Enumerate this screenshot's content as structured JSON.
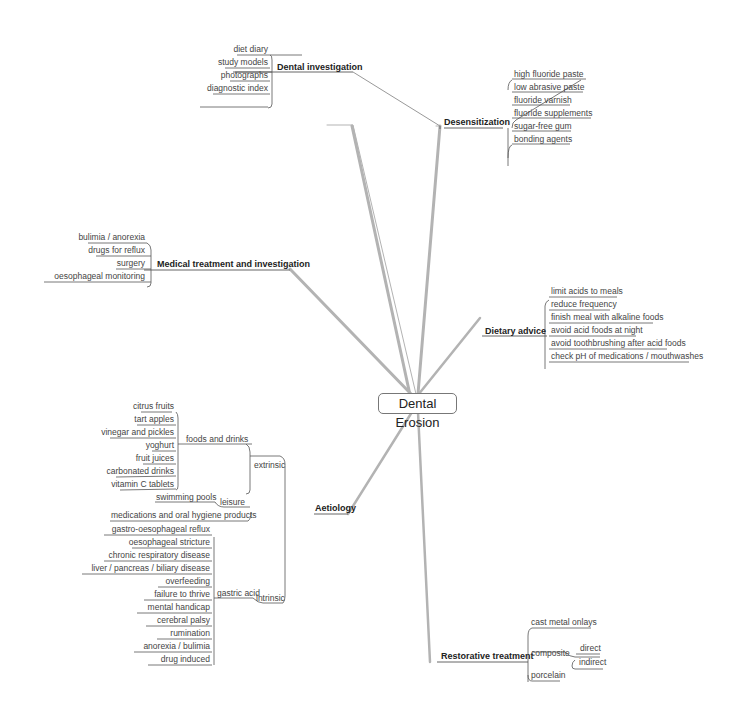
{
  "central_topic": "Dental Erosion",
  "branches": {
    "dental_investigation": {
      "title": "Dental investigation",
      "items": [
        "diet diary",
        "study models",
        "photographs",
        "diagnostic index"
      ]
    },
    "desensitization": {
      "title": "Desensitization",
      "items": [
        "high fluoride paste",
        "low abrasive paste",
        "fluoride varnish",
        "fluoride supplements",
        "sugar-free gum",
        "bonding agents"
      ]
    },
    "medical": {
      "title": "Medical treatment and investigation",
      "items": [
        "bulimia / anorexia",
        "drugs for reflux",
        "surgery",
        "oesophageal monitoring"
      ]
    },
    "dietary": {
      "title": "Dietary advice",
      "items": [
        "limit acids to meals",
        "reduce frequency",
        "finish meal with alkaline foods",
        "avoid acid foods at night",
        "avoid toothbrushing after acid foods",
        "check pH of medications / mouthwashes"
      ]
    },
    "aetiology": {
      "title": "Aetiology",
      "extrinsic": {
        "label": "extrinsic",
        "foods": {
          "label": "foods and drinks",
          "items": [
            "citrus fruits",
            "tart apples",
            "vinegar and pickles",
            "yoghurt",
            "fruit juices",
            "carbonated drinks",
            "vitamin C tablets"
          ]
        },
        "leisure": {
          "label": "leisure",
          "items": [
            "swimming pools"
          ]
        },
        "medications": "medications and oral hygiene products"
      },
      "intrinsic": {
        "label": "intrinsic",
        "gastric": {
          "label": "gastric acid",
          "items": [
            "gastro-oesophageal reflux",
            "oesophageal stricture",
            "chronic respiratory disease",
            "liver / pancreas / biliary disease",
            "overfeeding",
            "failure to thrive",
            "mental handicap",
            "cerebral palsy",
            "rumination",
            "anorexia / bulimia",
            "drug induced"
          ]
        }
      }
    },
    "restorative": {
      "title": "Restorative treatment",
      "items": {
        "cast": "cast metal onlays",
        "composite": {
          "label": "composite",
          "items": [
            "direct",
            "indirect"
          ]
        },
        "porcelain": "porcelain"
      }
    }
  },
  "colors": {
    "branch_line": "#aaaaaa",
    "leaf_line": "#555555"
  }
}
